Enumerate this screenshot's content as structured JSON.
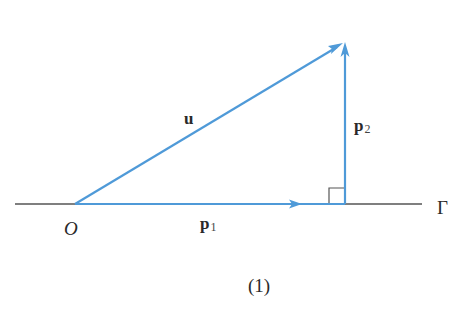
{
  "diagram": {
    "colors": {
      "vector": "#4f9ad8",
      "line": "#555555",
      "text": "#2a2a2a"
    },
    "points": {
      "origin": {
        "label": "O",
        "x": 75,
        "y": 204
      },
      "foot": {
        "x": 345,
        "y": 204
      },
      "tip": {
        "x": 345,
        "y": 42
      }
    },
    "line_gamma": {
      "label": "Γ",
      "x1": 15,
      "x2": 422,
      "y": 204
    },
    "vectors": [
      {
        "name": "u",
        "label": "u",
        "subscript": "",
        "from": "origin",
        "to": "tip"
      },
      {
        "name": "p1",
        "label": "p",
        "subscript": "1",
        "from": "origin",
        "to": "foot"
      },
      {
        "name": "p2",
        "label": "p",
        "subscript": "2",
        "from": "foot",
        "to": "tip"
      }
    ],
    "right_angle_marker": {
      "x": 329,
      "y": 188,
      "size": 16
    },
    "caption": "(1)"
  }
}
